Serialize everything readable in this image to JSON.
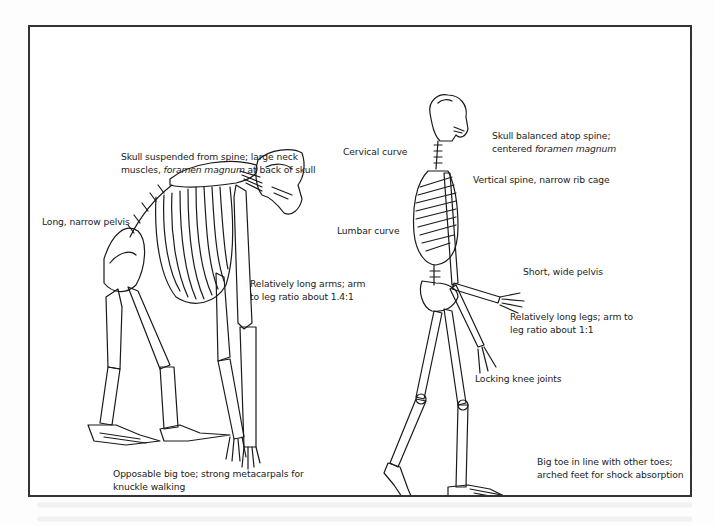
{
  "figure": {
    "chimpanzee": {
      "labels": {
        "skull": {
          "line1": "Skull suspended from spine; large neck",
          "line2_pre": "muscles, ",
          "line2_em": "foramen magnum",
          "line2_post": " at back of skull"
        },
        "pelvis": "Long, narrow pelvis",
        "arms": {
          "line1": "Relatively long arms; arm",
          "line2": "to leg ratio about 1.4:1"
        },
        "feet": {
          "line1": "Opposable big toe; strong metacarpals for",
          "line2": "knuckle walking"
        }
      }
    },
    "human": {
      "labels": {
        "skull": {
          "line1": "Skull balanced atop spine;",
          "line2_pre": "centered ",
          "line2_em": "foramen magnum"
        },
        "cervical": "Cervical curve",
        "spine": "Vertical spine, narrow rib cage",
        "lumbar": "Lumbar curve",
        "pelvis": "Short, wide pelvis",
        "legs": {
          "line1": "Relatively long legs; arm to",
          "line2": "leg ratio about 1:1"
        },
        "knee": "Locking knee joints",
        "feet": {
          "line1": "Big toe in line with other toes;",
          "line2": "arched feet for shock absorption"
        }
      }
    }
  },
  "colors": {
    "border": "#333333",
    "ink": "#222222",
    "paper": "#ffffff"
  }
}
